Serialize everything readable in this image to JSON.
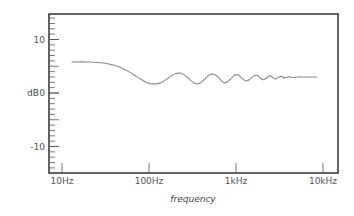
{
  "chart_data": {
    "type": "line",
    "title": "",
    "xlabel": "frequency",
    "ylabel": "dB",
    "xscale": "log",
    "xlim": [
      8.5,
      12000
    ],
    "ylim": [
      -15,
      15
    ],
    "x_ticks": [
      {
        "value": 10,
        "label": "10Hz"
      },
      {
        "value": 100,
        "label": "100Hz"
      },
      {
        "value": 1000,
        "label": "1kHz"
      },
      {
        "value": 10000,
        "label": "10kHz"
      }
    ],
    "y_ticks": [
      {
        "value": 10,
        "label": "10"
      },
      {
        "value": 0,
        "label": "0"
      },
      {
        "value": -10,
        "label": "-10"
      }
    ],
    "y_minor_step": 1,
    "grid": false,
    "legend": null,
    "series": [
      {
        "name": "response",
        "color": "#8a8a8a",
        "x": [
          13,
          20,
          30,
          40,
          50,
          60,
          70,
          80,
          90,
          100,
          110,
          120,
          130,
          140,
          160,
          180,
          200,
          230,
          260,
          290,
          320,
          360,
          400,
          450,
          500,
          560,
          620,
          680,
          740,
          800,
          880,
          960,
          1050,
          1150,
          1250,
          1350,
          1450,
          1600,
          1750,
          1900,
          2050,
          2250,
          2450,
          2650,
          2850,
          3100,
          3350,
          3600,
          3900,
          4200,
          4600,
          5200,
          6000,
          7000,
          8500
        ],
        "values": [
          5.8,
          5.8,
          5.6,
          5.2,
          4.6,
          3.9,
          3.2,
          2.6,
          2.1,
          1.8,
          1.7,
          1.7,
          1.8,
          2.0,
          2.6,
          3.2,
          3.6,
          3.7,
          3.3,
          2.6,
          2.0,
          1.7,
          2.0,
          2.8,
          3.4,
          3.5,
          3.0,
          2.3,
          1.9,
          2.1,
          2.7,
          3.3,
          3.4,
          2.9,
          2.4,
          2.3,
          2.6,
          3.2,
          3.3,
          2.8,
          2.5,
          2.8,
          3.2,
          2.9,
          2.6,
          3.0,
          3.1,
          2.8,
          3.0,
          3.0,
          2.9,
          3.0,
          3.0,
          3.0,
          3.0
        ]
      }
    ],
    "frame_color": "#222222",
    "tick_color": "#555555"
  }
}
